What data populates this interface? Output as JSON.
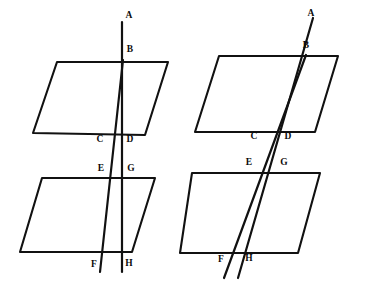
{
  "figure": {
    "background_color": "#ffffff",
    "ink_color": "#111111",
    "width": 365,
    "height": 286
  },
  "chart_data": {
    "type": "diagram",
    "grid": false,
    "legend": null,
    "figures": [
      {
        "name": "left-figure",
        "planes": [
          {
            "name": "upper-plane",
            "points": [
              [
                57,
                62
              ],
              [
                168,
                62
              ],
              [
                145,
                135
              ],
              [
                33,
                133
              ]
            ],
            "stroke_width": 2.1
          },
          {
            "name": "lower-plane",
            "points": [
              [
                42,
                178
              ],
              [
                155,
                178
              ],
              [
                132,
                252
              ],
              [
                20,
                252
              ]
            ],
            "stroke_width": 2.1
          }
        ],
        "lines": [
          {
            "name": "line-ABDGH",
            "from": [
              122,
              22
            ],
            "to": [
              122,
              272
            ],
            "stroke_width": 2.2
          },
          {
            "name": "line-BCEF",
            "from": [
              123,
              60
            ],
            "to": [
              100,
              272
            ],
            "stroke_width": 2.2
          }
        ],
        "labels": [
          {
            "text": "A",
            "x": 129,
            "y": 16
          },
          {
            "text": "B",
            "x": 130,
            "y": 50
          },
          {
            "text": "C",
            "x": 100,
            "y": 140
          },
          {
            "text": "D",
            "x": 130,
            "y": 140
          },
          {
            "text": "E",
            "x": 101,
            "y": 169
          },
          {
            "text": "G",
            "x": 131,
            "y": 169
          },
          {
            "text": "F",
            "x": 94,
            "y": 265
          },
          {
            "text": "H",
            "x": 129,
            "y": 264
          }
        ]
      },
      {
        "name": "right-figure",
        "planes": [
          {
            "name": "upper-plane",
            "points": [
              [
                219,
                56
              ],
              [
                338,
                56
              ],
              [
                315,
                132
              ],
              [
                195,
                132
              ]
            ],
            "stroke_width": 2.1
          },
          {
            "name": "lower-plane",
            "points": [
              [
                192,
                173
              ],
              [
                320,
                173
              ],
              [
                298,
                253
              ],
              [
                180,
                253
              ]
            ],
            "stroke_width": 2.1
          }
        ],
        "lines": [
          {
            "name": "line-ABDGH",
            "from": [
              313,
              18
            ],
            "to": [
              238,
              278
            ],
            "stroke_width": 2.2
          },
          {
            "name": "line-BCEF",
            "from": [
              306,
              55
            ],
            "to": [
              224,
              278
            ],
            "stroke_width": 2.2
          }
        ],
        "labels": [
          {
            "text": "A",
            "x": 311,
            "y": 14
          },
          {
            "text": "B",
            "x": 306,
            "y": 46
          },
          {
            "text": "C",
            "x": 254,
            "y": 137
          },
          {
            "text": "D",
            "x": 288,
            "y": 137
          },
          {
            "text": "E",
            "x": 249,
            "y": 163
          },
          {
            "text": "G",
            "x": 284,
            "y": 163
          },
          {
            "text": "F",
            "x": 221,
            "y": 260
          },
          {
            "text": "H",
            "x": 249,
            "y": 259
          }
        ]
      }
    ],
    "point_labels": [
      "A",
      "B",
      "C",
      "D",
      "E",
      "G",
      "F",
      "H"
    ]
  }
}
